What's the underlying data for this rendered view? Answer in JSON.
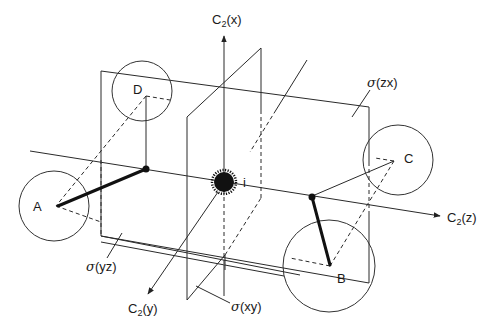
{
  "figure": {
    "axes": {
      "x": {
        "label": "C",
        "subscript": "2",
        "suffix": "(x)"
      },
      "y": {
        "label": "C",
        "subscript": "2",
        "suffix": "(y)"
      },
      "z": {
        "label": "C",
        "subscript": "2",
        "suffix": "(z)"
      }
    },
    "planes": {
      "zx": {
        "label": "σ",
        "suffix": "(zx)"
      },
      "yz": {
        "label": "σ",
        "suffix": "(yz)"
      },
      "xy": {
        "label": "σ",
        "suffix": "(xy)"
      }
    },
    "inversion_center": {
      "label": "i"
    },
    "atoms": [
      {
        "id": "A",
        "label": "A"
      },
      {
        "id": "B",
        "label": "B"
      },
      {
        "id": "C",
        "label": "C"
      },
      {
        "id": "D",
        "label": "D"
      }
    ],
    "colors": {
      "line": "#2a2a2a",
      "bond": "#111111",
      "background": "#ffffff"
    }
  }
}
